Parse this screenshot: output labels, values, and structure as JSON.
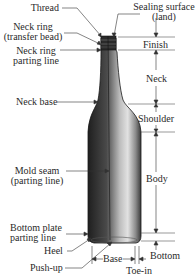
{
  "diagram": {
    "left_labels": {
      "thread": "Thread",
      "neck_ring_1": "Neck ring",
      "neck_ring_2": "(transfer bead)",
      "neck_ring_parting_1": "Neck ring",
      "neck_ring_parting_2": "parting line",
      "neck_base": "Neck base",
      "mold_seam_1": "Mold seam",
      "mold_seam_2": "(parting line)",
      "bottom_plate_1": "Bottom plate",
      "bottom_plate_2": "parting line",
      "heel": "Heel",
      "push_up": "Push-up"
    },
    "top_labels": {
      "sealing_1": "Sealing surface",
      "sealing_2": "(land)"
    },
    "right_labels": {
      "finish": "Finish",
      "neck": "Neck",
      "shoulder": "Shoulder",
      "body": "Body",
      "bottom": "Bottom"
    },
    "bottom_labels": {
      "base": "Base",
      "toe_in": "Toe-in"
    },
    "colors": {
      "line": "#333333",
      "bottle_dark": "#2e2e2e",
      "bottle_light": "#d8d8d8"
    }
  }
}
